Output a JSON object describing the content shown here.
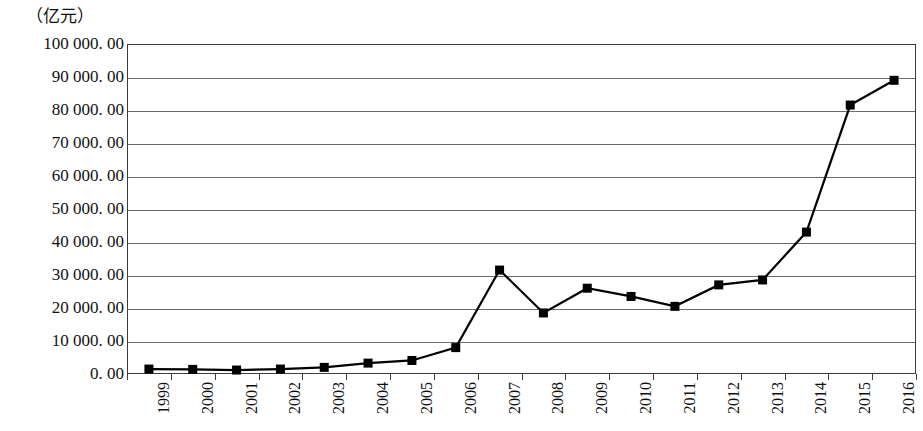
{
  "chart_data": {
    "type": "line",
    "title": "",
    "subtitle": "",
    "unit_label": "（亿元）",
    "xlabel": "",
    "ylabel": "亿元",
    "ylim": [
      0,
      100000
    ],
    "grid": true,
    "legend": "none",
    "marker": "square",
    "series_color": "#000000",
    "gridline_color": "#6b6b6b",
    "categories": [
      "1999",
      "2000",
      "2001",
      "2002",
      "2003",
      "2004",
      "2005",
      "2006",
      "2007",
      "2008",
      "2009",
      "2010",
      "2011",
      "2012",
      "2013",
      "2014",
      "2015",
      "2016"
    ],
    "y_ticks": [
      "0. 00",
      "10 000. 00",
      "20 000. 00",
      "30 000. 00",
      "40 000. 00",
      "50 000. 00",
      "60 000. 00",
      "70 000. 00",
      "80 000. 00",
      "90 000. 00",
      "100 000. 00"
    ],
    "y_tick_values": [
      0,
      10000,
      20000,
      30000,
      40000,
      50000,
      60000,
      70000,
      80000,
      90000,
      100000
    ],
    "series": [
      {
        "name": "金额",
        "values": [
          1500,
          1400,
          1200,
          1500,
          2000,
          3300,
          4100,
          8000,
          31500,
          18500,
          26000,
          23500,
          20500,
          27000,
          28500,
          43000,
          81500,
          89000
        ]
      }
    ]
  }
}
